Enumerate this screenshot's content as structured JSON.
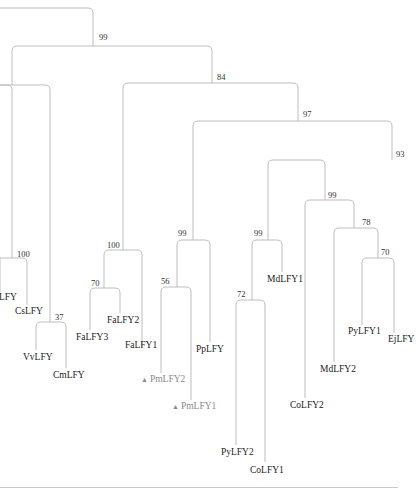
{
  "figure": {
    "type": "phylogenetic-tree",
    "colors": {
      "branch": "#bdbdbd",
      "label": "#222222",
      "highlight": "#8a8a8a"
    }
  },
  "bootstrap": {
    "root": "99",
    "n84": "84",
    "n97": "97",
    "n93": "93",
    "n99a": "99",
    "n78": "78",
    "n70a": "70",
    "n99b": "99",
    "n72": "72",
    "n99c": "99",
    "n56": "56",
    "n100a": "100",
    "n70b": "70",
    "n100b": "100",
    "n37": "37"
  },
  "leaves": {
    "cut_lfy": "LFY",
    "cslfy": "CsLFY",
    "vvlfy": "VvLFY",
    "cmlfy": "CmLFY",
    "falfy3": "FaLFY3",
    "falfy2": "FaLFY2",
    "falfy1": "FaLFY1",
    "pmlfy2": "PmLFY2",
    "pmlfy1": "PmLFY1",
    "pplfy": "PpLFY",
    "mdlfy1": "MdLFY1",
    "pylfy2": "PyLFY2",
    "colfy1": "CoLFY1",
    "colfy2": "CoLFY2",
    "mdlfy2": "MdLFY2",
    "pylfy1": "PyLFY1",
    "ejlfy": "EjLFY"
  },
  "markers": {
    "highlight_symbol": "▲"
  }
}
